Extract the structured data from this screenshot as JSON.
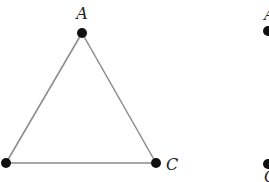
{
  "diagram": {
    "triangle": {
      "vertices": [
        {
          "id": "A",
          "label": "A",
          "x": 82,
          "y": 33,
          "lx": 82,
          "ly": 19
        },
        {
          "id": "B",
          "label": "",
          "x": 6,
          "y": 163
        },
        {
          "id": "C",
          "label": "C",
          "x": 156,
          "y": 163,
          "lx": 173,
          "ly": 170
        }
      ],
      "edge_color": "#8a8a8a",
      "vertex_color": "#111111"
    },
    "partial_figure": {
      "top_label": "A",
      "bottom_label": "C",
      "top_dot": {
        "x": 268,
        "y": 31
      },
      "bottom_dot": {
        "x": 268,
        "y": 164
      }
    }
  }
}
